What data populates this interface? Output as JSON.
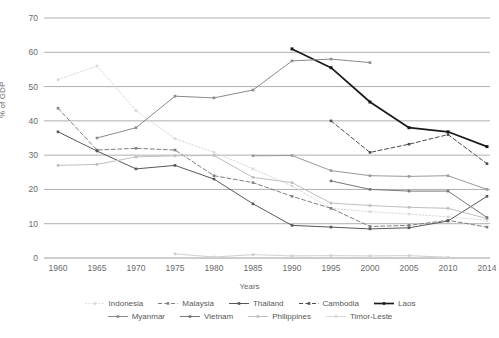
{
  "chart_data": {
    "type": "line",
    "title": "",
    "xlabel": "Years",
    "ylabel": "% of GDP",
    "ylim": [
      0,
      70
    ],
    "ytick_step": 10,
    "grid": true,
    "legend_position": "bottom",
    "categories": [
      "1960",
      "1965",
      "1970",
      "1975",
      "1980",
      "1985",
      "1990",
      "1995",
      "2000",
      "2005",
      "2010",
      "2014"
    ],
    "yticks": [
      "0",
      "10",
      "20",
      "30",
      "40",
      "50",
      "60",
      "70"
    ],
    "series": [
      {
        "name": "Indonesia",
        "color": "#d9d9d9",
        "style": "dotted",
        "marker": "square",
        "values": [
          52.0,
          56.0,
          43.0,
          34.8,
          30.8,
          26.0,
          21.0,
          14.5,
          13.5,
          12.8,
          12.0,
          11.0
        ]
      },
      {
        "name": "Malaysia",
        "color": "#808083",
        "style": "dashed",
        "marker": "square",
        "values": [
          43.7,
          31.5,
          32.0,
          31.5,
          24.0,
          22.0,
          18.0,
          14.5,
          9.2,
          9.5,
          11.0,
          9.0
        ]
      },
      {
        "name": "Thailand",
        "color": "#58585a",
        "style": "solid",
        "marker": "square",
        "values": [
          36.8,
          31.2,
          26.0,
          27.0,
          23.0,
          15.8,
          9.5,
          9.0,
          8.5,
          8.8,
          10.8,
          18.0
        ]
      },
      {
        "name": "Cambodia",
        "color": "#4d4d4f",
        "style": "dashed",
        "marker": "square",
        "values": [
          null,
          null,
          null,
          null,
          null,
          null,
          null,
          40.0,
          30.8,
          33.2,
          36.0,
          27.5
        ]
      },
      {
        "name": "Laos",
        "color": "#1a1a1a",
        "style": "solid",
        "marker": "square",
        "values": [
          null,
          null,
          null,
          null,
          null,
          null,
          61.0,
          55.5,
          45.5,
          38.0,
          36.8,
          32.5
        ]
      },
      {
        "name": "Myanmar",
        "color": "#8a8a8d",
        "style": "solid",
        "marker": "square",
        "values": [
          null,
          null,
          null,
          null,
          null,
          null,
          null,
          null,
          null,
          null,
          null,
          null
        ]
      },
      {
        "name": "Vietnam",
        "color": "#8a8a8d",
        "style": "solid",
        "marker": "square",
        "values": [
          null,
          35.0,
          38.0,
          47.2,
          46.7,
          49.0,
          57.5,
          58.0,
          57.0,
          null,
          null,
          null
        ]
      },
      {
        "name": "Philippines",
        "color": "#bfbfc1",
        "style": "solid",
        "marker": "square",
        "values": [
          27.0,
          27.3,
          29.5,
          29.8,
          29.9,
          23.5,
          22.0,
          16.0,
          15.3,
          14.8,
          14.5,
          11.5
        ]
      },
      {
        "name": "Timor-Leste",
        "color": "#d0d0d2",
        "style": "solid",
        "marker": "square",
        "values": [
          null,
          null,
          null,
          1.2,
          0.3,
          1.0,
          0.6,
          0.7,
          0.6,
          0.7,
          0.2,
          null
        ]
      },
      {
        "name": "Myanmar-series",
        "color": "#9a9a9d",
        "style": "solid",
        "marker": "square",
        "hidden_in_legend": false,
        "values": [
          null,
          null,
          null,
          null,
          null,
          29.8,
          29.9,
          25.5,
          24.0,
          23.8,
          24.0,
          20.0
        ]
      },
      {
        "name": "Vietnam-lower",
        "color": "#77777a",
        "style": "solid",
        "marker": "square",
        "values": [
          null,
          null,
          null,
          null,
          null,
          null,
          null,
          22.5,
          20.0,
          19.5,
          19.5,
          11.8
        ]
      }
    ]
  },
  "legend": {
    "rows": [
      [
        {
          "label": "Indonesia",
          "color": "#d9d9d9",
          "style": "dotted"
        },
        {
          "label": "Malaysia",
          "color": "#808083",
          "style": "dashed"
        },
        {
          "label": "Thailand",
          "color": "#58585a",
          "style": "solid"
        },
        {
          "label": "Cambodia",
          "color": "#4d4d4f",
          "style": "dashed"
        },
        {
          "label": "Laos",
          "color": "#1a1a1a",
          "style": "solid"
        }
      ],
      [
        {
          "label": "Myanmar",
          "color": "#8a8a8d",
          "style": "solid"
        },
        {
          "label": "Vietnam",
          "color": "#77777a",
          "style": "solid"
        },
        {
          "label": "Philippines",
          "color": "#bfbfc1",
          "style": "solid"
        },
        {
          "label": "Timor-Leste",
          "color": "#d9d9d9",
          "style": "solid"
        }
      ]
    ]
  }
}
